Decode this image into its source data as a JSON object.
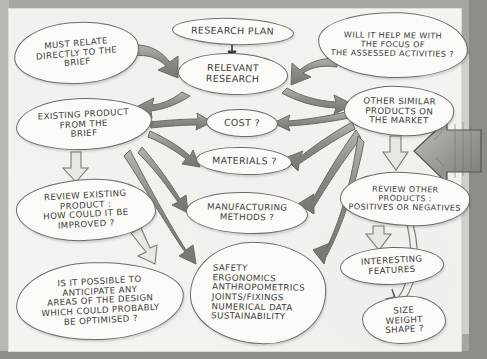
{
  "document": {
    "title": "Research Plan Mind Map",
    "medium": "hand-drawn pencil sketch on white paper",
    "paper_color": "#f4f3ef",
    "ink_color": "#3a3a38",
    "arrow_fill": "#8f8d88"
  },
  "nodes": [
    {
      "id": "must-relate",
      "label": "MUST RELATE\nDIRECTLY TO THE\nBRIEF",
      "x": 14,
      "y": 22,
      "w": 125,
      "h": 62,
      "shape": "e2",
      "tilt": "tilt-l",
      "size": "sz-s"
    },
    {
      "id": "research-plan",
      "label": "RESEARCH PLAN",
      "x": 172,
      "y": 18,
      "w": 122,
      "h": 27,
      "shape": "e1",
      "tilt": "tilt-r",
      "size": "sz-m"
    },
    {
      "id": "will-it-help",
      "label": "WILL IT HELP ME WITH\nTHE FOCUS OF\nTHE ASSESSED ACTIVITIES ?",
      "x": 318,
      "y": 12,
      "w": 150,
      "h": 66,
      "shape": "e3",
      "tilt": "tilt-r",
      "size": "sz-xs"
    },
    {
      "id": "relevant-research",
      "label": "RELEVANT\nRESEARCH",
      "x": 178,
      "y": 53,
      "w": 110,
      "h": 42,
      "shape": "e1",
      "tilt": "tilt-r",
      "size": "sz-m"
    },
    {
      "id": "existing-product",
      "label": "EXISTING PRODUCT\nFROM THE\nBRIEF",
      "x": 16,
      "y": 98,
      "w": 136,
      "h": 52,
      "shape": "e4",
      "tilt": "tilt-l2",
      "size": "sz-s"
    },
    {
      "id": "other-similar",
      "label": "OTHER SIMILAR\nPRODUCTS ON\nTHE MARKET",
      "x": 344,
      "y": 86,
      "w": 110,
      "h": 50,
      "shape": "e2",
      "tilt": "tilt-r",
      "size": "sz-s"
    },
    {
      "id": "cost",
      "label": "COST ?",
      "x": 206,
      "y": 109,
      "w": 72,
      "h": 28,
      "shape": "e1",
      "tilt": "tilt-r",
      "size": "sz-m"
    },
    {
      "id": "materials",
      "label": "MATERIALS ?",
      "x": 196,
      "y": 147,
      "w": 96,
      "h": 28,
      "shape": "e1",
      "tilt": "tilt-r",
      "size": "sz-m"
    },
    {
      "id": "review-existing",
      "label": "REVIEW EXISTING\nPRODUCT :\nHOW COULD IT BE\nIMPROVED ?",
      "x": 16,
      "y": 179,
      "w": 140,
      "h": 62,
      "shape": "e3",
      "tilt": "tilt-l2",
      "size": "sz-s"
    },
    {
      "id": "manufacturing",
      "label": "MANUFACTURING\nMETHODS  ?",
      "x": 186,
      "y": 192,
      "w": 122,
      "h": 42,
      "shape": "e1",
      "tilt": "tilt-r",
      "size": "sz-s"
    },
    {
      "id": "review-other",
      "label": "REVIEW OTHER\nPRODUCTS :\nPOSITIVES OR NEGATIVES",
      "x": 340,
      "y": 172,
      "w": 130,
      "h": 54,
      "shape": "e2",
      "tilt": "tilt-r",
      "size": "sz-xs"
    },
    {
      "id": "interesting-features",
      "label": "INTERESTING\nFEATURES",
      "x": 340,
      "y": 247,
      "w": 104,
      "h": 38,
      "shape": "e1",
      "tilt": "tilt-l2",
      "size": "sz-s"
    },
    {
      "id": "is-it-possible",
      "label": "IS IT POSSIBLE TO\nANTICIPATE ANY\nAREAS OF THE DESIGN\nWHICH COULD PROBABLY\nBE OPTIMISED ?",
      "x": 16,
      "y": 262,
      "w": 168,
      "h": 78,
      "shape": "e4",
      "tilt": "tilt-l2",
      "size": "sz-s"
    },
    {
      "id": "safety-list",
      "label": "SAFETY\nERGONOMICS\nANTHROPOMETRICS\nJOINTS/FIXINGS\nNUMERICAL DATA\nSUSTAINABILITY",
      "x": 190,
      "y": 242,
      "w": 136,
      "h": 102,
      "shape": "e2",
      "tilt": "tilt-r",
      "size": "sz-s"
    },
    {
      "id": "size-weight-shape",
      "label": "SIZE\nWEIGHT\nSHAPE ?",
      "x": 362,
      "y": 296,
      "w": 84,
      "h": 48,
      "shape": "e3",
      "tilt": "tilt-l2",
      "size": "sz-s"
    }
  ],
  "edges": [
    {
      "id": "must-relate-to-relevant-research",
      "from": "must-relate",
      "to": "relevant-research",
      "style": "thick-arrow"
    },
    {
      "id": "research-plan-to-relevant-research",
      "from": "research-plan",
      "to": "relevant-research",
      "style": "thin-arrow"
    },
    {
      "id": "will-it-help-to-relevant-research",
      "from": "will-it-help",
      "to": "relevant-research",
      "style": "thick-arrow"
    },
    {
      "id": "relevant-research-to-existing",
      "from": "relevant-research",
      "to": "existing-product",
      "style": "thick-arrow"
    },
    {
      "id": "relevant-research-to-other-similar",
      "from": "relevant-research",
      "to": "other-similar",
      "style": "thick-arrow"
    },
    {
      "id": "existing-to-cost",
      "from": "existing-product",
      "to": "cost",
      "style": "thick-arrow"
    },
    {
      "id": "existing-to-materials",
      "from": "existing-product",
      "to": "materials",
      "style": "thick-arrow"
    },
    {
      "id": "existing-to-manufacturing",
      "from": "existing-product",
      "to": "manufacturing",
      "style": "thick-arrow"
    },
    {
      "id": "existing-to-safety-list",
      "from": "existing-product",
      "to": "safety-list",
      "style": "thick-arrow"
    },
    {
      "id": "existing-to-review-existing",
      "from": "existing-product",
      "to": "review-existing",
      "style": "outline-arrow"
    },
    {
      "id": "review-existing-to-is-it-possible",
      "from": "review-existing",
      "to": "is-it-possible",
      "style": "outline-arrow"
    },
    {
      "id": "other-similar-to-cost",
      "from": "other-similar",
      "to": "cost",
      "style": "thick-arrow"
    },
    {
      "id": "other-similar-to-materials",
      "from": "other-similar",
      "to": "materials",
      "style": "thick-arrow"
    },
    {
      "id": "other-similar-to-manufacturing",
      "from": "other-similar",
      "to": "manufacturing",
      "style": "thick-arrow"
    },
    {
      "id": "other-similar-to-safety-list",
      "from": "other-similar",
      "to": "safety-list",
      "style": "thick-arrow"
    },
    {
      "id": "other-similar-to-review-other",
      "from": "other-similar",
      "to": "review-other",
      "style": "outline-arrow"
    },
    {
      "id": "review-other-to-interesting",
      "from": "review-other",
      "to": "interesting-features",
      "style": "outline-arrow"
    },
    {
      "id": "review-other-to-size-weight-shape",
      "from": "review-other",
      "to": "size-weight-shape",
      "style": "thin-line-arrow"
    },
    {
      "id": "external-into-review-other",
      "from": "page-edge",
      "to": "review-other",
      "style": "big-shaded-arrow"
    }
  ]
}
